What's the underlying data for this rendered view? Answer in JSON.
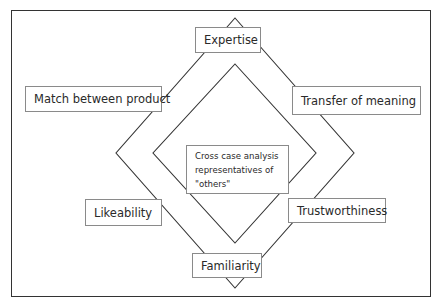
{
  "diagram": {
    "nodes": {
      "top": "Expertise",
      "upper_left": "Match between product",
      "upper_right": "Transfer of meaning",
      "lower_left": "Likeability",
      "lower_right": "Trustworthiness",
      "bottom": "Familiarity"
    },
    "center": {
      "lines": [
        "Cross case analysis",
        "representatives of",
        "\"others\""
      ]
    },
    "colors": {
      "line": "#333333",
      "box_border": "#8a8a8a",
      "text": "#2a2a2a"
    }
  }
}
